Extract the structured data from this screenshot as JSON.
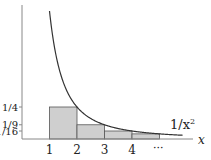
{
  "function_label": "1/x",
  "function_exponent": "2",
  "x_axis_label": "x",
  "x_ticks": [
    {
      "value": 1,
      "label": "1"
    },
    {
      "value": 2,
      "label": "2"
    },
    {
      "value": 3,
      "label": "3"
    },
    {
      "value": 4,
      "label": "4"
    }
  ],
  "ellipsis": "···",
  "y_ticks": [
    {
      "value": 0.25,
      "label": "1/4"
    },
    {
      "value": 0.1111,
      "label": "1/9"
    },
    {
      "value": 0.0625,
      "label": "1/16"
    }
  ],
  "rectangles": [
    {
      "x_start": 1,
      "x_end": 2,
      "height": 0.25
    },
    {
      "x_start": 2,
      "x_end": 3,
      "height": 0.1111
    },
    {
      "x_start": 3,
      "x_end": 4,
      "height": 0.0625
    },
    {
      "x_start": 4,
      "x_end": 5,
      "height": 0.04
    }
  ],
  "colors": {
    "bar_fill": "#cfcfcf",
    "bar_stroke": "#555555",
    "curve": "#333333",
    "axis": "#777777"
  }
}
